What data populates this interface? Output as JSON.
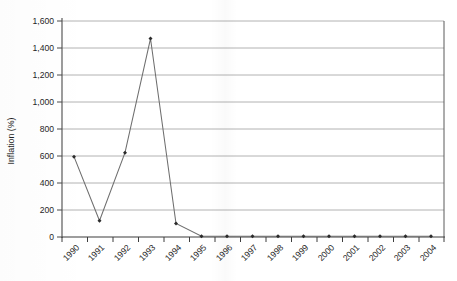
{
  "chart_data": {
    "type": "line",
    "title": "",
    "xlabel": "",
    "ylabel": "Inflation (%)",
    "categories": [
      "1990",
      "1991",
      "1992",
      "1993",
      "1994",
      "1995",
      "1996",
      "1997",
      "1998",
      "1999",
      "2000",
      "2001",
      "2002",
      "2003",
      "2004"
    ],
    "values": [
      595,
      120,
      625,
      1470,
      100,
      5,
      5,
      5,
      5,
      5,
      5,
      5,
      5,
      5,
      5
    ],
    "series": [
      {
        "name": "Inflation (%)",
        "values": [
          595,
          120,
          625,
          1470,
          100,
          5,
          5,
          5,
          5,
          5,
          5,
          5,
          5,
          5,
          5
        ]
      }
    ],
    "ylim": [
      0,
      1600
    ],
    "ytick_labels": [
      "1,600",
      "1,400",
      "1,200",
      "1,000",
      "800",
      "600",
      "400",
      "200",
      "0"
    ],
    "ytick_values": [
      1600,
      1400,
      1200,
      1000,
      800,
      600,
      400,
      200,
      0
    ],
    "grid": "horizontal",
    "legend": "none",
    "marker": "diamond",
    "line_color": "#6e6e6e",
    "marker_color": "#2b2b2b",
    "grid_color": "#a9a9a9",
    "axis_color": "#4a4a4a",
    "background": "#ffffff",
    "xtick_rotation": -45
  }
}
